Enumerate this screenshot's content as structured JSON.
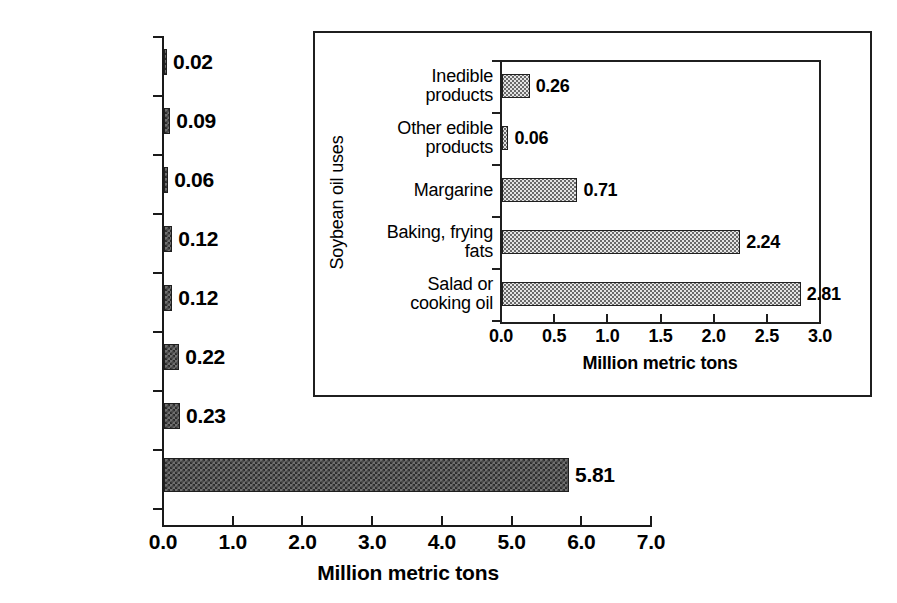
{
  "chart_data": [
    {
      "id": "main",
      "type": "bar",
      "orientation": "horizontal",
      "title": "",
      "xlabel": "Million metric tons",
      "ylabel": "",
      "xlim": [
        0.0,
        7.0
      ],
      "xticks": [
        "0.0",
        "1.0",
        "2.0",
        "3.0",
        "4.0",
        "5.0",
        "6.0",
        "7.0"
      ],
      "xtick_values": [
        0.0,
        1.0,
        2.0,
        3.0,
        4.0,
        5.0,
        6.0,
        7.0
      ],
      "grid": false,
      "legend": "none",
      "categories": [
        "Other",
        "Peanut",
        "Coconut",
        "Edible tallow",
        "Lard",
        "Cottonseed",
        "Canola",
        "Soybean"
      ],
      "values": [
        0.02,
        0.09,
        0.06,
        0.12,
        0.12,
        0.22,
        0.23,
        5.81
      ],
      "value_labels": [
        "0.02",
        "0.09",
        "0.06",
        "0.12",
        "0.12",
        "0.22",
        "0.23",
        "5.81"
      ]
    },
    {
      "id": "inset",
      "type": "bar",
      "orientation": "horizontal",
      "title": "",
      "xlabel": "Million metric tons",
      "ylabel": "Soybean oil uses",
      "xlim": [
        0.0,
        3.0
      ],
      "xticks": [
        "0.0",
        "0.5",
        "1.0",
        "1.5",
        "2.0",
        "2.5",
        "3.0"
      ],
      "xtick_values": [
        0.0,
        0.5,
        1.0,
        1.5,
        2.0,
        2.5,
        3.0
      ],
      "grid": false,
      "legend": "none",
      "categories": [
        "Inedible products",
        "Other edible products",
        "Margarine",
        "Baking, frying fats",
        "Salad or cooking oil"
      ],
      "category_lines": [
        [
          "Inedible",
          "products"
        ],
        [
          "Other edible",
          "products"
        ],
        [
          "Margarine"
        ],
        [
          "Baking, frying",
          "fats"
        ],
        [
          "Salad or",
          "cooking oil"
        ]
      ],
      "values": [
        0.26,
        0.06,
        0.71,
        2.24,
        2.81
      ],
      "value_labels": [
        "0.26",
        "0.06",
        "0.71",
        "2.24",
        "2.81"
      ]
    }
  ],
  "colors": {
    "ink": "#1f1f1f",
    "main_bar_fill": "#6f6f6f",
    "main_bar_pattern": "#2b2b2b",
    "inset_bar_fill": "#e4e4e4",
    "inset_bar_pattern": "#6a6a6a",
    "background": "#ffffff"
  }
}
